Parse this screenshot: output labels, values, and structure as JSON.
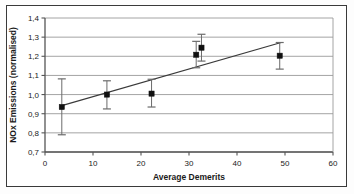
{
  "chart_data": {
    "type": "scatter",
    "title": "",
    "subtitle": "",
    "xlabel": "Average Demerits",
    "ylabel": "NOx Emissions (normalised)",
    "xlim": [
      0,
      60
    ],
    "ylim": [
      0.7,
      1.4
    ],
    "xticks": [
      0,
      10,
      20,
      30,
      40,
      50,
      60
    ],
    "yticks": [
      0.7,
      0.8,
      0.9,
      1.0,
      1.1,
      1.2,
      1.3,
      1.4
    ],
    "xtick_labels": [
      "0",
      "10",
      "20",
      "30",
      "40",
      "50",
      "60"
    ],
    "ytick_labels": [
      "0,7",
      "0,8",
      "0,9",
      "1,0",
      "1,1",
      "1,2",
      "1,3",
      "1,4"
    ],
    "decimal_separator": ",",
    "grid": "horizontal",
    "legend": "none",
    "marker": "filled-square",
    "marker_color": "#111111",
    "errorbar_color": "#6b6b6b",
    "trendline_color": "#3a3a3a",
    "points": [
      {
        "x": 3.5,
        "y": 0.935,
        "yerr_low": 0.79,
        "yerr_high": 1.082
      },
      {
        "x": 12.9,
        "y": 1.0,
        "yerr_low": 0.925,
        "yerr_high": 1.072
      },
      {
        "x": 22.2,
        "y": 1.005,
        "yerr_low": 0.935,
        "yerr_high": 1.08
      },
      {
        "x": 31.5,
        "y": 1.208,
        "yerr_low": 1.14,
        "yerr_high": 1.278
      },
      {
        "x": 32.6,
        "y": 1.245,
        "yerr_low": 1.175,
        "yerr_high": 1.315
      },
      {
        "x": 48.9,
        "y": 1.203,
        "yerr_low": 1.133,
        "yerr_high": 1.272
      }
    ],
    "trendline": {
      "x0": 3.5,
      "y0": 0.942,
      "x1": 49.2,
      "y1": 1.272
    }
  },
  "axes": {
    "x_title": "Average Demerits",
    "y_title": "NOx Emissions (normalised)"
  }
}
